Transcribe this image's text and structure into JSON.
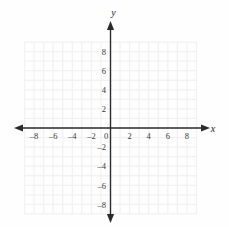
{
  "figure": {
    "background_color": "#fefefe",
    "grid_color": "#f2f2f2",
    "axis_color": "#2b2b2b",
    "label_color": "#3a3a3a"
  },
  "axes": {
    "x": {
      "name": "x",
      "min": -9,
      "max": 9,
      "tick_step": 2,
      "labels": [
        "-8",
        "-6",
        "-4",
        "-2",
        "0",
        "2",
        "4",
        "6",
        "8"
      ],
      "label_values": [
        -8,
        -6,
        -4,
        -2,
        0,
        2,
        4,
        6,
        8
      ],
      "arrow_both_ends": true
    },
    "y": {
      "name": "y",
      "min": -9,
      "max": 9,
      "tick_step": 2,
      "labels": [
        "8",
        "6",
        "4",
        "2",
        "-2",
        "-4",
        "-6",
        "-8"
      ],
      "label_values": [
        8,
        6,
        4,
        2,
        -2,
        -4,
        -6,
        -8
      ],
      "arrow_both_ends": true
    }
  },
  "chart_data": {
    "type": "scatter",
    "title": "",
    "subtitle": "",
    "xlabel": "x",
    "ylabel": "y",
    "xlim": [
      -9,
      9
    ],
    "ylim": [
      -9,
      9
    ],
    "xticks": [
      -8,
      -6,
      -4,
      -2,
      0,
      2,
      4,
      6,
      8
    ],
    "yticks": [
      -8,
      -6,
      -4,
      -2,
      2,
      4,
      6,
      8
    ],
    "xticklabels": [
      "-8",
      "-6",
      "-4",
      "-2",
      "0",
      "2",
      "4",
      "6",
      "8"
    ],
    "yticklabels": [
      "-8",
      "-6",
      "-4",
      "-2",
      "2",
      "4",
      "6",
      "8"
    ],
    "grid": true,
    "grid_minor": true,
    "grid_step": 1,
    "legend": null,
    "legend_position": "none",
    "series": [],
    "x": [],
    "values": [],
    "annotations": [],
    "origin_label": "0"
  }
}
